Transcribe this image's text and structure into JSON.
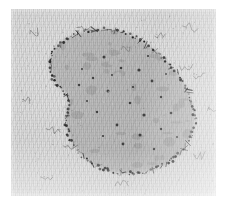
{
  "figure": {
    "kind": "electron-micrograph",
    "caption": "",
    "plate": {
      "x": 11,
      "y": 9,
      "width": 205,
      "height": 187,
      "background_color": "#d9d9d9",
      "border_color": "#ffffff"
    }
  },
  "palette": {
    "plate_background": "#d9d9d9",
    "body_fill": "#a9a9a9",
    "body_fill_dark": "#9b9b9b",
    "boundary_dark": "#1f1f1f",
    "particle_dark": "#262626",
    "thread_gray": "#7a7a7a",
    "paper_white": "#ffffff"
  },
  "micrograph": {
    "specimen_label": "nucleoid-body",
    "body": {
      "name": "central-body",
      "shape": "kidney-bean",
      "outline_path": "M 41 66 C 34 52 42 36 58 28 C 76 19 98 18 114 24 C 131 30 146 42 158 55 C 170 68 180 84 183 101 C 186 118 180 135 166 147 C 151 160 130 166 110 164 C 91 162 75 152 65 139 C 56 127 53 113 56 101 C 58 92 57 86 50 80 C 45 75 43 71 41 66 Z",
      "fill": "#a9a9a9",
      "opacity": 0.62
    },
    "boundary": {
      "name": "beaded-membrane",
      "description": "dense dark beaded particle chain tracing the body outline",
      "bead_count": 190,
      "bead_radius_px": [
        0.5,
        1.5
      ],
      "color": "#1f1f1f"
    },
    "interior_particles": {
      "name": "interior-dark-dots",
      "color": "#2a2a2a",
      "points": [
        [
          93,
          48,
          1.5
        ],
        [
          110,
          59,
          1.3
        ],
        [
          128,
          61,
          1.6
        ],
        [
          82,
          69,
          1.2
        ],
        [
          141,
          72,
          1.4
        ],
        [
          68,
          76,
          1.2
        ],
        [
          97,
          82,
          1.5
        ],
        [
          119,
          94,
          1.3
        ],
        [
          150,
          88,
          1.2
        ],
        [
          133,
          106,
          1.6
        ],
        [
          86,
          103,
          1.2
        ],
        [
          106,
          116,
          1.4
        ],
        [
          129,
          126,
          1.5
        ],
        [
          150,
          120,
          1.2
        ],
        [
          112,
          135,
          1.4
        ],
        [
          92,
          127,
          1.1
        ],
        [
          160,
          104,
          1.3
        ],
        [
          143,
          140,
          1.2
        ],
        [
          76,
          92,
          1.0
        ],
        [
          166,
          128,
          1.1
        ],
        [
          101,
          66,
          1.0
        ],
        [
          122,
          78,
          1.1
        ],
        [
          155,
          65,
          1.0
        ],
        [
          71,
          60,
          1.0
        ],
        [
          137,
          47,
          1.1
        ]
      ]
    },
    "background_threads": {
      "name": "free-strand-fragments",
      "color": "#6f6f6f",
      "items": [
        {
          "x": 18,
          "y": 22,
          "w": 9,
          "h": 6,
          "rot": -18
        },
        {
          "x": 66,
          "y": 16,
          "w": 13,
          "h": 5,
          "rot": 6
        },
        {
          "x": 144,
          "y": 25,
          "w": 10,
          "h": 5,
          "rot": -4
        },
        {
          "x": 172,
          "y": 14,
          "w": 16,
          "h": 6,
          "rot": 10
        },
        {
          "x": 110,
          "y": 38,
          "w": 9,
          "h": 5,
          "rot": -12
        },
        {
          "x": 169,
          "y": 54,
          "w": 13,
          "h": 6,
          "rot": 8
        },
        {
          "x": 182,
          "y": 64,
          "w": 12,
          "h": 6,
          "rot": -6
        },
        {
          "x": 36,
          "y": 117,
          "w": 14,
          "h": 6,
          "rot": 7
        },
        {
          "x": 52,
          "y": 134,
          "w": 11,
          "h": 6,
          "rot": -9
        },
        {
          "x": 30,
          "y": 165,
          "w": 12,
          "h": 6,
          "rot": 5
        },
        {
          "x": 104,
          "y": 173,
          "w": 13,
          "h": 6,
          "rot": -5
        },
        {
          "x": 183,
          "y": 142,
          "w": 11,
          "h": 6,
          "rot": 9
        },
        {
          "x": 196,
          "y": 99,
          "w": 9,
          "h": 5,
          "rot": -14
        },
        {
          "x": 12,
          "y": 88,
          "w": 8,
          "h": 5,
          "rot": 12
        }
      ]
    }
  }
}
